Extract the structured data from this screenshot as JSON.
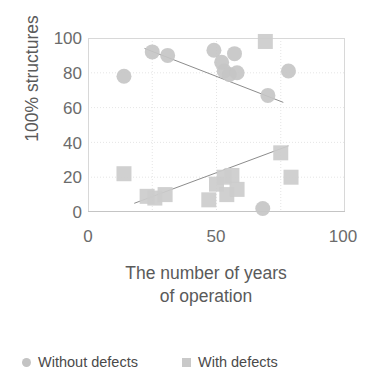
{
  "chart_data": {
    "type": "scatter",
    "title": "",
    "xlabel": "The number of years of operation",
    "xlabel_line1": "The number of years",
    "xlabel_line2": "of operation",
    "ylabel": "100% structures",
    "xlim": [
      0,
      100
    ],
    "ylim": [
      0,
      100
    ],
    "xticks": [
      0,
      50,
      100
    ],
    "yticks": [
      0,
      20,
      40,
      60,
      80,
      100
    ],
    "xtick_labels": [
      "0",
      "50",
      "100"
    ],
    "ytick_labels": [
      "0",
      "20",
      "40",
      "60",
      "80",
      "100"
    ],
    "grid": true,
    "grid_color": "#dedede",
    "legend_position": "bottom",
    "series": [
      {
        "name": "Without defects",
        "marker": "circle",
        "color": "#c6c6c6",
        "points": [
          [
            14,
            78
          ],
          [
            25,
            92
          ],
          [
            31,
            90
          ],
          [
            49,
            93
          ],
          [
            52,
            86
          ],
          [
            53,
            81
          ],
          [
            55,
            79
          ],
          [
            57,
            91
          ],
          [
            58,
            80
          ],
          [
            70,
            67
          ],
          [
            78,
            81
          ],
          [
            68,
            2
          ]
        ],
        "trendline": {
          "x1": 22,
          "y1": 94,
          "x2": 76,
          "y2": 63,
          "slope_sign": "negative"
        }
      },
      {
        "name": "With defects",
        "marker": "square",
        "color": "#cccccc",
        "points": [
          [
            14,
            22
          ],
          [
            23,
            9
          ],
          [
            26,
            8
          ],
          [
            30,
            10
          ],
          [
            47,
            7
          ],
          [
            50,
            16
          ],
          [
            53,
            20
          ],
          [
            54,
            10
          ],
          [
            56,
            21
          ],
          [
            58,
            13
          ],
          [
            75,
            34
          ],
          [
            79,
            20
          ],
          [
            69,
            98
          ]
        ],
        "trendline": {
          "x1": 18,
          "y1": 5,
          "x2": 78,
          "y2": 38,
          "slope_sign": "positive"
        }
      }
    ]
  },
  "legend": {
    "items": [
      {
        "label": "Without defects",
        "marker": "circle"
      },
      {
        "label": "With defects",
        "marker": "square"
      }
    ]
  }
}
